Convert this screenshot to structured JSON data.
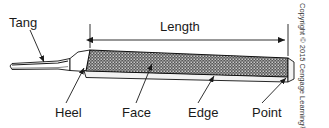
{
  "figure": {
    "copyright": "Copyright © 2015 Cengage Learning®"
  },
  "dimension": {
    "label": "Length"
  },
  "labels": {
    "tang": "Tang",
    "heel": "Heel",
    "face": "Face",
    "edge": "Edge",
    "point": "Point"
  },
  "colors": {
    "outline": "#111111",
    "face_fill": "#575757",
    "face_speck": "#c9c9c9",
    "edge_fill": "#f2f2f2",
    "tang_fill": "#ffffff",
    "tang_core": "#1a1a1a",
    "text": "#1a1a1a",
    "background": "#ffffff"
  }
}
